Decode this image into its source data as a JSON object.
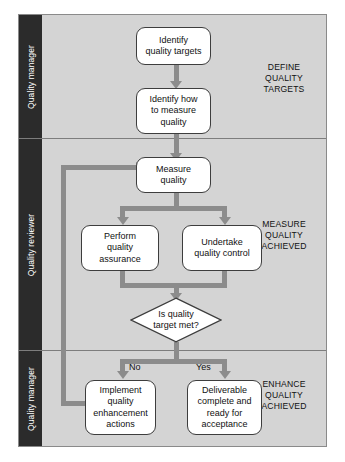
{
  "diagram": {
    "background_color": "#d4d4d4",
    "lane_label_color": "#2b2b2b",
    "connector_color": "#8c8c8c",
    "node_border_color": "#3d3d3d",
    "node_fill_color": "#ffffff",
    "lanes": [
      {
        "id": "lane-quality-manager-top",
        "label": "Quality manager"
      },
      {
        "id": "lane-quality-reviewer",
        "label": "Quality reviewer"
      },
      {
        "id": "lane-quality-manager-bottom",
        "label": "Quality manager"
      }
    ],
    "phases": [
      {
        "id": "phase-define",
        "label": "DEFINE\nQUALITY\nTARGETS",
        "line1": "DEFINE",
        "line2": "QUALITY",
        "line3": "TARGETS"
      },
      {
        "id": "phase-measure",
        "label": "MEASURE\nQUALITY\nACHIEVED",
        "line1": "MEASURE",
        "line2": "QUALITY",
        "line3": "ACHIEVED"
      },
      {
        "id": "phase-enhance",
        "label": "ENHANCE\nQUALITY\nACHIEVED",
        "line1": "ENHANCE",
        "line2": "QUALITY",
        "line3": "ACHIEVED"
      }
    ],
    "nodes": [
      {
        "id": "identify-quality-targets",
        "type": "process",
        "label": "Identify quality targets",
        "lane": "Quality manager"
      },
      {
        "id": "identify-how-to-measure-quality",
        "type": "process",
        "label": "Identify how to measure quality",
        "lane": "Quality manager"
      },
      {
        "id": "measure-quality",
        "type": "process",
        "label": "Measure quality",
        "lane": "Quality reviewer"
      },
      {
        "id": "perform-quality-assurance",
        "type": "process",
        "label": "Perform quality assurance",
        "lane": "Quality reviewer"
      },
      {
        "id": "undertake-quality-control",
        "type": "process",
        "label": "Undertake quality control",
        "lane": "Quality reviewer"
      },
      {
        "id": "is-quality-target-met",
        "type": "decision",
        "label": "Is quality target met?",
        "lane": "Quality reviewer"
      },
      {
        "id": "implement-quality-enhancement-actions",
        "type": "process",
        "label": "Implement quality enhancement actions",
        "lane": "Quality manager"
      },
      {
        "id": "deliverable-complete-and-ready-for-acceptance",
        "type": "process",
        "label": "Deliverable complete and ready for acceptance",
        "lane": "Quality manager"
      }
    ],
    "edges": [
      {
        "id": "edge-targets-to-measure-how",
        "from": "identify-quality-targets",
        "to": "identify-how-to-measure-quality",
        "label": ""
      },
      {
        "id": "edge-measure-how-to-measure-quality",
        "from": "identify-how-to-measure-quality",
        "to": "measure-quality",
        "label": ""
      },
      {
        "id": "edge-measure-to-qa",
        "from": "measure-quality",
        "to": "perform-quality-assurance",
        "label": ""
      },
      {
        "id": "edge-measure-to-qc",
        "from": "measure-quality",
        "to": "undertake-quality-control",
        "label": ""
      },
      {
        "id": "edge-qa-to-decision",
        "from": "perform-quality-assurance",
        "to": "is-quality-target-met",
        "label": ""
      },
      {
        "id": "edge-qc-to-decision",
        "from": "undertake-quality-control",
        "to": "is-quality-target-met",
        "label": ""
      },
      {
        "id": "edge-decision-no",
        "from": "is-quality-target-met",
        "to": "implement-quality-enhancement-actions",
        "label": "No"
      },
      {
        "id": "edge-decision-yes",
        "from": "is-quality-target-met",
        "to": "deliverable-complete-and-ready-for-acceptance",
        "label": "Yes"
      },
      {
        "id": "edge-loop-back-to-measure",
        "from": "implement-quality-enhancement-actions",
        "to": "measure-quality",
        "label": ""
      }
    ],
    "branch_labels": {
      "no": "No",
      "yes": "Yes"
    },
    "node_text": {
      "identify_quality_targets": {
        "line1": "Identify",
        "line2": "quality targets"
      },
      "identify_how_to_measure_quality": {
        "line1": "Identify how",
        "line2": "to measure",
        "line3": "quality"
      },
      "measure_quality": {
        "line1": "Measure",
        "line2": "quality"
      },
      "perform_quality_assurance": {
        "line1": "Perform",
        "line2": "quality",
        "line3": "assurance"
      },
      "undertake_quality_control": {
        "line1": "Undertake",
        "line2": "quality control"
      },
      "is_quality_target_met": {
        "line1": "Is quality",
        "line2": "target met?"
      },
      "implement_quality_enhancement_actions": {
        "line1": "Implement",
        "line2": "quality",
        "line3": "enhancement",
        "line4": "actions"
      },
      "deliverable_complete_and_ready_for_acceptance": {
        "line1": "Deliverable",
        "line2": "complete and",
        "line3": "ready for",
        "line4": "acceptance"
      }
    }
  }
}
